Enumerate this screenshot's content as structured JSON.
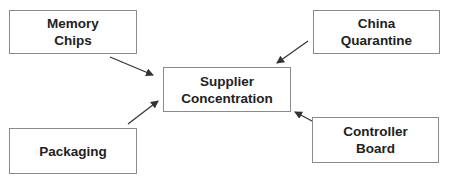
{
  "diagram": {
    "type": "influence-diagram",
    "center": {
      "id": "supplier-concentration",
      "label": "Supplier\nConcentration"
    },
    "nodes": [
      {
        "id": "memory-chips",
        "label": "Memory\nChips"
      },
      {
        "id": "china-quarantine",
        "label": "China\nQuarantine"
      },
      {
        "id": "packaging",
        "label": "Packaging"
      },
      {
        "id": "controller-board",
        "label": "Controller\nBoard"
      }
    ],
    "edges": [
      {
        "from": "memory-chips",
        "to": "supplier-concentration"
      },
      {
        "from": "china-quarantine",
        "to": "supplier-concentration"
      },
      {
        "from": "packaging",
        "to": "supplier-concentration"
      },
      {
        "from": "controller-board",
        "to": "supplier-concentration"
      }
    ],
    "colors": {
      "border": "#8a8a8a",
      "text": "#222222",
      "arrow": "#333333",
      "background": "#ffffff"
    }
  }
}
